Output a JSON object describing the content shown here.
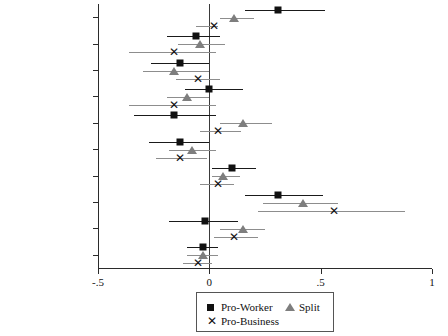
{
  "chart_data": {
    "type": "scatter",
    "title": "",
    "xlabel": "",
    "ylabel": "",
    "orientation": "horizontal",
    "plot_style": "coefficient / forest plot with 95% confidence intervals",
    "xlim": [
      -0.5,
      1.0
    ],
    "xticks": [
      -0.5,
      0,
      0.5,
      1
    ],
    "xticklabels": [
      "-.5",
      "0",
      ".5",
      "1"
    ],
    "grid": false,
    "reference_line": 0,
    "legend_position": "below-axis-center",
    "categories": [
      "Strikes (Change)",
      "Log GDP per Capita",
      "% Migrant",
      "% SOE",
      "Labor NGOs",
      "Collective Contracts",
      "Population",
      "% Urban",
      "Remuneration",
      "Constant"
    ],
    "series": [
      {
        "name": "Pro-Worker",
        "marker": "square",
        "color": "#111111",
        "values": [
          0.31,
          -0.06,
          -0.13,
          0.0,
          -0.16,
          -0.13,
          0.1,
          0.31,
          -0.02,
          -0.03
        ],
        "ci_low": [
          0.16,
          -0.19,
          -0.26,
          -0.11,
          -0.34,
          -0.27,
          0.01,
          0.16,
          -0.18,
          -0.1
        ],
        "ci_high": [
          0.52,
          0.05,
          0.0,
          0.15,
          0.03,
          0.0,
          0.21,
          0.51,
          0.13,
          0.04
        ]
      },
      {
        "name": "Split",
        "marker": "triangle",
        "color": "#7e7e7e",
        "values": [
          0.11,
          -0.04,
          -0.16,
          -0.1,
          0.15,
          -0.08,
          0.06,
          0.42,
          0.15,
          -0.03
        ],
        "ci_low": [
          0.05,
          -0.14,
          -0.3,
          -0.19,
          0.05,
          -0.18,
          0.01,
          0.24,
          0.05,
          -0.1
        ],
        "ci_high": [
          0.2,
          0.07,
          0.0,
          0.0,
          0.28,
          0.03,
          0.14,
          0.58,
          0.25,
          0.04
        ]
      },
      {
        "name": "Pro-Business",
        "marker": "x",
        "color": "#111111",
        "values": [
          0.02,
          -0.16,
          -0.05,
          -0.16,
          0.04,
          -0.13,
          0.04,
          0.56,
          0.11,
          -0.05
        ],
        "ci_low": [
          -0.06,
          -0.36,
          -0.15,
          -0.36,
          -0.04,
          -0.24,
          -0.04,
          0.22,
          0.02,
          -0.12
        ],
        "ci_high": [
          0.04,
          0.03,
          0.05,
          0.03,
          0.14,
          -0.01,
          0.11,
          0.88,
          0.22,
          0.01
        ]
      }
    ]
  },
  "legend": {
    "entries": [
      {
        "label": "Pro-Worker",
        "marker": "square"
      },
      {
        "label": "Split",
        "marker": "triangle"
      },
      {
        "label": "Pro-Business",
        "marker": "x"
      }
    ]
  }
}
